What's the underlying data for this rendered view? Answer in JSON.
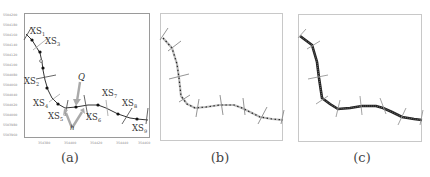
{
  "panels": [
    {
      "id": "a",
      "caption": "(a)",
      "y_tick_labels": [
        "5504200",
        "5504180",
        "5504160",
        "5504140",
        "5504120",
        "5504100",
        "5504080",
        "5504060",
        "5504040",
        "5504020",
        "5504000",
        "5503980",
        "5503960"
      ],
      "x_tick_labels": [
        "354380",
        "354400",
        "354420",
        "354440",
        "354460"
      ],
      "cross_section_labels": [
        {
          "name": "XS",
          "sub": "1"
        },
        {
          "name": "XS",
          "sub": "3"
        },
        {
          "name": "XS",
          "sub": "2"
        },
        {
          "name": "XS",
          "sub": "4"
        },
        {
          "name": "XS",
          "sub": "5"
        },
        {
          "name": "XS",
          "sub": "6"
        },
        {
          "name": "XS",
          "sub": "7"
        },
        {
          "name": "XS",
          "sub": "8"
        },
        {
          "name": "XS",
          "sub": "9"
        }
      ],
      "annotations": {
        "point_label": "Q",
        "offset_label": "h"
      }
    },
    {
      "id": "b",
      "caption": "(b)"
    },
    {
      "id": "c",
      "caption": "(c)"
    }
  ],
  "colors": {
    "line": "#222222",
    "cross_section": "#999999",
    "frame": "#c8c8c8",
    "arrow": "#aaaaaa"
  }
}
